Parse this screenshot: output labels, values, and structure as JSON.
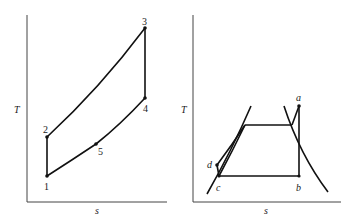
{
  "left_diagram": {
    "title": "",
    "y_axis_label": "T",
    "x_axis_label": "s",
    "points": [
      {
        "label": "1",
        "x": 47,
        "y": 176
      },
      {
        "label": "2",
        "x": 47,
        "y": 137
      },
      {
        "label": "3",
        "x": 145,
        "y": 28
      },
      {
        "label": "4",
        "x": 145,
        "y": 98
      },
      {
        "label": "5",
        "x": 96,
        "y": 144
      }
    ]
  },
  "right_diagram": {
    "title": "",
    "y_axis_label": "T",
    "x_axis_label": "s",
    "points": [
      {
        "label": "a",
        "x": 299,
        "y": 106
      },
      {
        "label": "b",
        "x": 299,
        "y": 176
      },
      {
        "label": "c",
        "x": 219,
        "y": 176
      },
      {
        "label": "d",
        "x": 217,
        "y": 165
      }
    ]
  },
  "colors": {
    "line": "#111111",
    "axis": "#444444",
    "background": "#ffffff"
  }
}
